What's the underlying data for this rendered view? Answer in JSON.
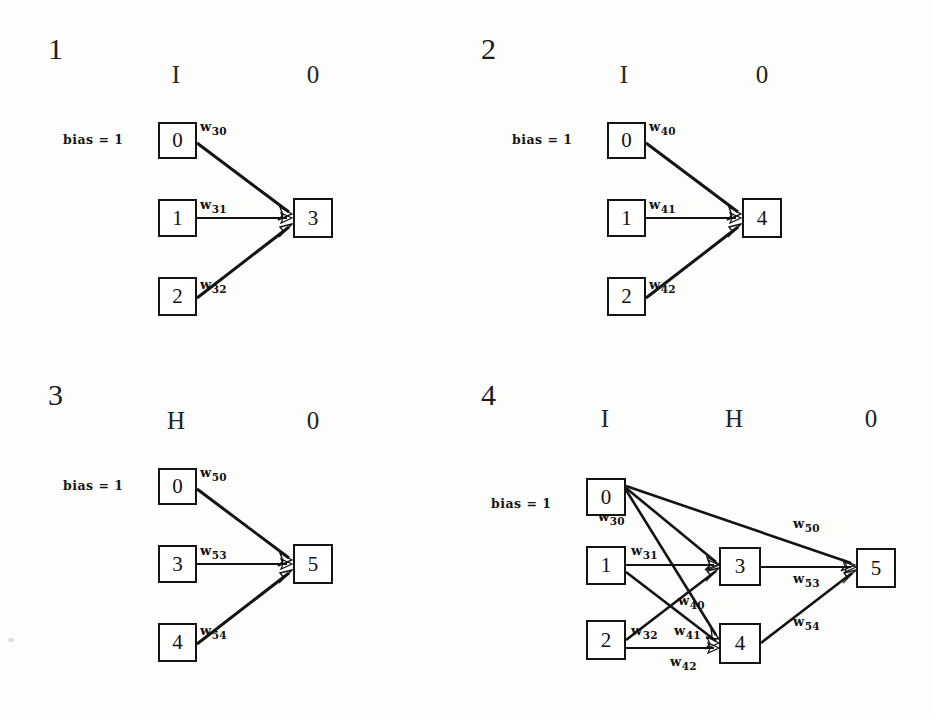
{
  "figure": {
    "background_color": "#fdfdfc",
    "ink_color": "#141414",
    "type": "neural-network-construction-diagram",
    "panel_count": 4
  },
  "panels": [
    {
      "number": "1",
      "headers": [
        "I",
        "0"
      ],
      "bias_label": "bias = 1",
      "nodes": [
        "0",
        "1",
        "2",
        "3"
      ],
      "weights": [
        "30",
        "31",
        "32"
      ],
      "weight_symbol": "w",
      "edges": [
        {
          "from": "0",
          "to": "3",
          "label_base": "w",
          "label_sub": "30"
        },
        {
          "from": "1",
          "to": "3",
          "label_base": "w",
          "label_sub": "31"
        },
        {
          "from": "2",
          "to": "3",
          "label_base": "w",
          "label_sub": "32"
        }
      ]
    },
    {
      "number": "2",
      "headers": [
        "I",
        "0"
      ],
      "bias_label": "bias = 1",
      "nodes": [
        "0",
        "1",
        "2",
        "4"
      ],
      "weights": [
        "40",
        "41",
        "42"
      ],
      "weight_symbol": "w",
      "edges": [
        {
          "from": "0",
          "to": "4",
          "label_base": "w",
          "label_sub": "40"
        },
        {
          "from": "1",
          "to": "4",
          "label_base": "w",
          "label_sub": "41"
        },
        {
          "from": "2",
          "to": "4",
          "label_base": "w",
          "label_sub": "42"
        }
      ]
    },
    {
      "number": "3",
      "headers": [
        "H",
        "0"
      ],
      "bias_label": "bias = 1",
      "nodes": [
        "0",
        "3",
        "4",
        "5"
      ],
      "weights": [
        "50",
        "53",
        "54"
      ],
      "weight_symbol": "w",
      "edges": [
        {
          "from": "0",
          "to": "5",
          "label_base": "w",
          "label_sub": "50"
        },
        {
          "from": "3",
          "to": "5",
          "label_base": "w",
          "label_sub": "53"
        },
        {
          "from": "4",
          "to": "5",
          "label_base": "w",
          "label_sub": "54"
        }
      ]
    },
    {
      "number": "4",
      "headers": [
        "I",
        "H",
        "0"
      ],
      "bias_label": "bias = 1",
      "nodes": [
        "0",
        "1",
        "2",
        "3",
        "4",
        "5"
      ],
      "weights": [
        "30",
        "31",
        "32",
        "40",
        "41",
        "42",
        "50",
        "53",
        "54"
      ],
      "weight_symbol": "w",
      "edges": [
        {
          "from": "0",
          "to": "3",
          "label_base": "w",
          "label_sub": "30"
        },
        {
          "from": "1",
          "to": "3",
          "label_base": "w",
          "label_sub": "31"
        },
        {
          "from": "2",
          "to": "3",
          "label_base": "w",
          "label_sub": "32"
        },
        {
          "from": "0",
          "to": "4",
          "label_base": "w",
          "label_sub": "40"
        },
        {
          "from": "1",
          "to": "4",
          "label_base": "w",
          "label_sub": "41"
        },
        {
          "from": "2",
          "to": "4",
          "label_base": "w",
          "label_sub": "42"
        },
        {
          "from": "0",
          "to": "5",
          "label_base": "w",
          "label_sub": "50"
        },
        {
          "from": "3",
          "to": "5",
          "label_base": "w",
          "label_sub": "53"
        },
        {
          "from": "4",
          "to": "5",
          "label_base": "w",
          "label_sub": "54"
        }
      ]
    }
  ]
}
